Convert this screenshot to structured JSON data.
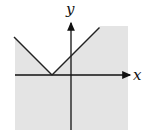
{
  "chart_data": {
    "type": "line",
    "title": "",
    "xlabel": "x",
    "ylabel": "y",
    "function": "y = |x + 1|",
    "inequality": "y <= |x + 1|",
    "shaded_region": "below the V-shaped graph",
    "vertex": [
      -1,
      0
    ],
    "y_intercept": 1,
    "xlim": [
      -3,
      3
    ],
    "ylim": [
      -3,
      2.5
    ],
    "grid": false,
    "series": [
      {
        "name": "left-branch",
        "x": [
          -3,
          -1
        ],
        "y": [
          2,
          0
        ]
      },
      {
        "name": "right-branch",
        "x": [
          -1,
          1.5
        ],
        "y": [
          0,
          2.5
        ]
      }
    ],
    "colors": {
      "shade": "#e4e4e4",
      "line": "#222222",
      "axis": "#111111"
    }
  }
}
